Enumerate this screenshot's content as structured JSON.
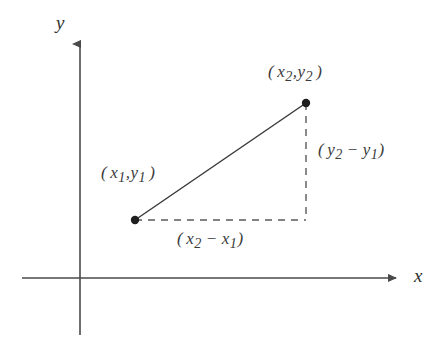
{
  "figure": {
    "kind": "coordinate-plane-distance-formula",
    "background_color": "#ffffff",
    "line_color": "#3b3b3b",
    "axis_color": "#4a4a4a",
    "text_color": "#3b3b3b"
  },
  "axes": {
    "x_label": "x",
    "y_label": "y",
    "origin": {
      "x": 80,
      "y": 278
    },
    "x_axis": {
      "start_x": 22,
      "end_x": 398,
      "y": 278,
      "arrow": "right"
    },
    "y_axis": {
      "x": 80,
      "start_y": 335,
      "end_y": 42,
      "arrow": "up"
    }
  },
  "points": [
    {
      "name": "point-1",
      "label_open": "(",
      "var_x": "x",
      "sub_x": "1",
      "separator": ",",
      "var_y": "y",
      "sub_y": "1",
      "label_close": ")",
      "label_text": "( x₁, y₁ )",
      "cx": 135,
      "cy": 220,
      "r": 4
    },
    {
      "name": "point-2",
      "label_open": "(",
      "var_x": "x",
      "sub_x": "2",
      "separator": ",",
      "var_y": "y",
      "sub_y": "2",
      "label_close": ")",
      "label_text": "( x₂, y₂ )",
      "cx": 306,
      "cy": 103,
      "r": 4
    }
  ],
  "segments": {
    "hypotenuse": {
      "x1": 135,
      "y1": 220,
      "x2": 306,
      "y2": 103,
      "style": "solid"
    },
    "horizontal_leg": {
      "x1": 135,
      "y1": 220,
      "x2": 306,
      "y2": 220,
      "style": "dashed"
    },
    "vertical_leg": {
      "x1": 306,
      "y1": 103,
      "x2": 306,
      "y2": 220,
      "style": "dashed"
    }
  },
  "leg_labels": {
    "delta_x": {
      "open": "(",
      "first_var": "x",
      "first_sub": "2",
      "operator": "−",
      "second_var": "x",
      "second_sub": "1",
      "close": ")",
      "text": "( x₂ − x₁ )"
    },
    "delta_y": {
      "open": "(",
      "first_var": "y",
      "first_sub": "2",
      "operator": "−",
      "second_var": "y",
      "second_sub": "1",
      "close": ")",
      "text": "( y₂ − y₁ )"
    }
  }
}
